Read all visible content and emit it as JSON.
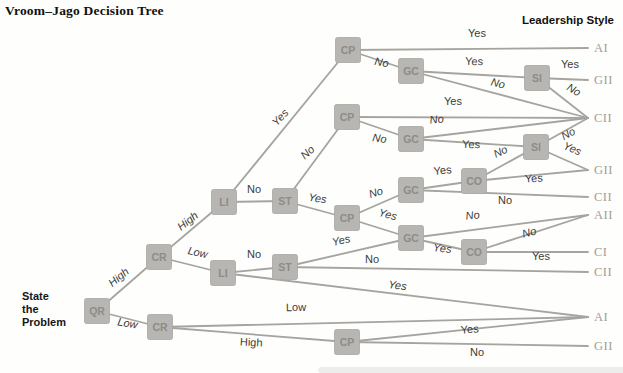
{
  "title": "Vroom–Jago Decision Tree",
  "legend_header": "Leadership Style",
  "start_label": "State\nthe\nProblem",
  "colors": {
    "node_fill": "#b7b6b2",
    "node_border": "#a7a6a2",
    "node_text": "#8d8c88",
    "edge": "#a5a4a0",
    "edge_label": "#3b3b3b",
    "outcome_text": "#9e9d95"
  },
  "tree": {
    "node_size": 25,
    "nodes": [
      {
        "id": "QR",
        "label": "QR",
        "x": 97,
        "y": 311
      },
      {
        "id": "CR1",
        "label": "CR",
        "x": 159,
        "y": 257
      },
      {
        "id": "CR2",
        "label": "CR",
        "x": 160,
        "y": 327
      },
      {
        "id": "LI1",
        "label": "LI",
        "x": 224,
        "y": 202
      },
      {
        "id": "LI2",
        "label": "LI",
        "x": 223,
        "y": 273
      },
      {
        "id": "ST1",
        "label": "ST",
        "x": 285,
        "y": 201
      },
      {
        "id": "ST2",
        "label": "ST",
        "x": 285,
        "y": 267
      },
      {
        "id": "CP1",
        "label": "CP",
        "x": 348,
        "y": 50
      },
      {
        "id": "CP2",
        "label": "CP",
        "x": 347,
        "y": 117
      },
      {
        "id": "CP3",
        "label": "CP",
        "x": 347,
        "y": 218
      },
      {
        "id": "CP4",
        "label": "CP",
        "x": 347,
        "y": 342
      },
      {
        "id": "GC1",
        "label": "GC",
        "x": 411,
        "y": 71
      },
      {
        "id": "GC2",
        "label": "GC",
        "x": 411,
        "y": 139
      },
      {
        "id": "GC3",
        "label": "GC",
        "x": 411,
        "y": 190
      },
      {
        "id": "GC4",
        "label": "GC",
        "x": 411,
        "y": 238
      },
      {
        "id": "SI1",
        "label": "SI",
        "x": 537,
        "y": 78
      },
      {
        "id": "SI2",
        "label": "SI",
        "x": 536,
        "y": 147
      },
      {
        "id": "CO1",
        "label": "CO",
        "x": 474,
        "y": 181
      },
      {
        "id": "CO2",
        "label": "CO",
        "x": 474,
        "y": 252
      }
    ],
    "outcomes": [
      {
        "id": "O1",
        "label": "AI",
        "x": 588,
        "y": 48
      },
      {
        "id": "O2",
        "label": "GII",
        "x": 588,
        "y": 80
      },
      {
        "id": "O3",
        "label": "CII",
        "x": 588,
        "y": 118
      },
      {
        "id": "O4",
        "label": "GII",
        "x": 588,
        "y": 170
      },
      {
        "id": "O5",
        "label": "CII",
        "x": 588,
        "y": 197
      },
      {
        "id": "O6",
        "label": "AII",
        "x": 588,
        "y": 215
      },
      {
        "id": "O7",
        "label": "CI",
        "x": 588,
        "y": 252
      },
      {
        "id": "O8",
        "label": "CII",
        "x": 588,
        "y": 272
      },
      {
        "id": "O9",
        "label": "AI",
        "x": 588,
        "y": 317
      },
      {
        "id": "O10",
        "label": "GII",
        "x": 588,
        "y": 346
      }
    ],
    "edges": [
      {
        "from": "QR",
        "to": "CR1",
        "label": "High",
        "lx": 121,
        "ly": 280,
        "rot": -40,
        "italic": true
      },
      {
        "from": "QR",
        "to": "CR2",
        "label": "Low",
        "lx": 127,
        "ly": 327,
        "rot": 10,
        "italic": true
      },
      {
        "from": "CR1",
        "to": "LI1",
        "label": "High",
        "lx": 190,
        "ly": 224,
        "rot": -38,
        "italic": true
      },
      {
        "from": "CR1",
        "to": "LI2",
        "label": "Low",
        "lx": 197,
        "ly": 256,
        "rot": 12,
        "italic": true
      },
      {
        "from": "LI1",
        "to": "CP1",
        "label": "Yes",
        "lx": 283,
        "ly": 120,
        "rot": -48,
        "italic": true
      },
      {
        "from": "LI1",
        "to": "ST1",
        "label": "No",
        "lx": 254,
        "ly": 193,
        "rot": 0,
        "italic": false
      },
      {
        "from": "LI2",
        "to": "ST2",
        "label": "No",
        "lx": 254,
        "ly": 258,
        "rot": 0,
        "italic": false
      },
      {
        "from": "LI2",
        "to": "O9",
        "label": "Yes",
        "lx": 397,
        "ly": 289,
        "rot": 7,
        "italic": true
      },
      {
        "from": "ST1",
        "to": "CP2",
        "label": "No",
        "lx": 310,
        "ly": 155,
        "rot": -42,
        "italic": true
      },
      {
        "from": "ST1",
        "to": "CP3",
        "label": "Yes",
        "lx": 317,
        "ly": 202,
        "rot": 8,
        "italic": true
      },
      {
        "from": "ST2",
        "to": "GC4",
        "label": "Yes",
        "lx": 342,
        "ly": 244,
        "rot": -13,
        "italic": true
      },
      {
        "from": "ST2",
        "to": "O8",
        "label": "No",
        "lx": 372,
        "ly": 263,
        "rot": 0,
        "italic": false
      },
      {
        "from": "CP1",
        "to": "O1",
        "label": "Yes",
        "lx": 477,
        "ly": 37,
        "rot": 0,
        "italic": false
      },
      {
        "from": "CP1",
        "to": "GC1",
        "label": "No",
        "lx": 381,
        "ly": 66,
        "rot": 10,
        "italic": true
      },
      {
        "from": "CP2",
        "to": "O3",
        "label": "Yes",
        "lx": 453,
        "ly": 105,
        "rot": 0,
        "italic": false
      },
      {
        "from": "CP2",
        "to": "GC2",
        "label": "No",
        "lx": 379,
        "ly": 142,
        "rot": 8,
        "italic": true
      },
      {
        "from": "CP3",
        "to": "GC3",
        "label": "No",
        "lx": 377,
        "ly": 196,
        "rot": -17,
        "italic": true
      },
      {
        "from": "CP3",
        "to": "GC4",
        "label": "Yes",
        "lx": 387,
        "ly": 218,
        "rot": 14,
        "italic": true
      },
      {
        "from": "CP4",
        "to": "O9",
        "label": "Yes",
        "lx": 470,
        "ly": 333,
        "rot": -5,
        "italic": false
      },
      {
        "from": "CP4",
        "to": "O10",
        "label": "No",
        "lx": 477,
        "ly": 356,
        "rot": 0,
        "italic": false
      },
      {
        "from": "GC1",
        "to": "SI1",
        "label": "Yes",
        "lx": 474,
        "ly": 65,
        "rot": 2,
        "italic": false
      },
      {
        "from": "GC1",
        "to": "O3",
        "label": "No",
        "lx": 497,
        "ly": 87,
        "rot": 14,
        "italic": true
      },
      {
        "from": "GC2",
        "to": "SI2",
        "label": "Yes",
        "lx": 471,
        "ly": 148,
        "rot": 2,
        "italic": false
      },
      {
        "from": "GC2",
        "to": "O3",
        "label": "No",
        "lx": 437,
        "ly": 123,
        "rot": -6,
        "italic": true
      },
      {
        "from": "GC3",
        "to": "CO1",
        "label": "Yes",
        "lx": 443,
        "ly": 174,
        "rot": -6,
        "italic": false
      },
      {
        "from": "GC3",
        "to": "O5",
        "label": "No",
        "lx": 505,
        "ly": 204,
        "rot": 0,
        "italic": false
      },
      {
        "from": "GC4",
        "to": "O6",
        "label": "No",
        "lx": 473,
        "ly": 219,
        "rot": -7,
        "italic": true
      },
      {
        "from": "GC4",
        "to": "CO2",
        "label": "Yes",
        "lx": 442,
        "ly": 252,
        "rot": 6,
        "italic": true
      },
      {
        "from": "CO1",
        "to": "SI2",
        "label": "No",
        "lx": 502,
        "ly": 155,
        "rot": -25,
        "italic": true
      },
      {
        "from": "CO1",
        "to": "O4",
        "label": "Yes",
        "lx": 534,
        "ly": 182,
        "rot": -3,
        "italic": false
      },
      {
        "from": "CO2",
        "to": "O6",
        "label": "No",
        "lx": 530,
        "ly": 236,
        "rot": -14,
        "italic": true
      },
      {
        "from": "CO2",
        "to": "O7",
        "label": "Yes",
        "lx": 541,
        "ly": 260,
        "rot": 0,
        "italic": false
      },
      {
        "from": "SI1",
        "to": "O2",
        "label": "Yes",
        "lx": 570,
        "ly": 68,
        "rot": 0,
        "italic": false
      },
      {
        "from": "SI1",
        "to": "O3",
        "label": "No",
        "lx": 572,
        "ly": 93,
        "rot": 30,
        "italic": true
      },
      {
        "from": "SI2",
        "to": "O3",
        "label": "No",
        "lx": 570,
        "ly": 137,
        "rot": -28,
        "italic": true
      },
      {
        "from": "SI2",
        "to": "O4",
        "label": "Yes",
        "lx": 571,
        "ly": 152,
        "rot": 23,
        "italic": true
      },
      {
        "from": "CR2",
        "to": "O9",
        "label": "Low",
        "lx": 296,
        "ly": 311,
        "rot": -1,
        "italic": false
      },
      {
        "from": "CR2",
        "to": "CP4",
        "label": "High",
        "lx": 251,
        "ly": 346,
        "rot": 3,
        "italic": false
      }
    ]
  }
}
